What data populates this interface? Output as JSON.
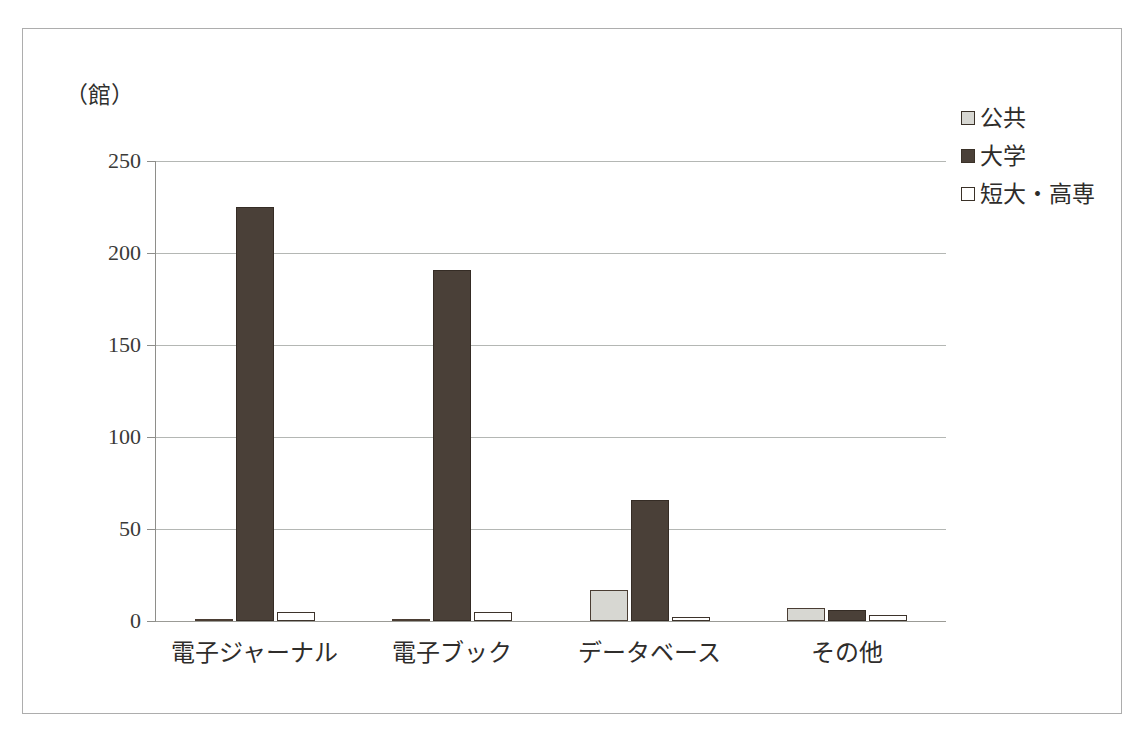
{
  "chart_data": {
    "type": "bar",
    "title": "",
    "subtitle": "",
    "unit_caption": "（館）",
    "xlabel": "",
    "ylabel": "",
    "ylim": [
      0,
      250
    ],
    "yticks": [
      0,
      50,
      100,
      150,
      200,
      250
    ],
    "ytick_labels": [
      "0",
      "50",
      "100",
      "150",
      "200",
      "250"
    ],
    "grid": true,
    "legend_position": "top-right",
    "categories": [
      "電子ジャーナル",
      "電子ブック",
      "データベース",
      "その他"
    ],
    "series": [
      {
        "name": "公共",
        "color": "#d7d7d2",
        "values": [
          1,
          1,
          17,
          7
        ]
      },
      {
        "name": "大学",
        "color": "#4a4038",
        "values": [
          225,
          191,
          66,
          6
        ]
      },
      {
        "name": "短大・高専",
        "color": "#ffffff",
        "values": [
          5,
          5,
          2,
          3
        ]
      }
    ]
  },
  "legend": {
    "items": [
      {
        "label": "公共",
        "swatch": "legend-swatch-kokyo"
      },
      {
        "label": "大学",
        "swatch": "legend-swatch-daigaku"
      },
      {
        "label": "短大・高専",
        "swatch": "legend-swatch-tandai"
      }
    ]
  },
  "axis": {
    "unit": "（館）",
    "tick_0": "0",
    "tick_50": "50",
    "tick_100": "100",
    "tick_150": "150",
    "tick_200": "200",
    "tick_250": "250"
  },
  "colors": {
    "frame": "#adadad",
    "gridline": "#b4b7b4",
    "axis": "#8e8e8a",
    "text": "#2f2d2b",
    "series_kokyo": "#d7d7d2",
    "series_daigaku": "#4a4038",
    "series_tandai": "#ffffff",
    "bar_outline": "#3d332b"
  }
}
